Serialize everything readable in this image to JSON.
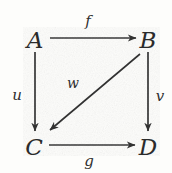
{
  "diagram": {
    "type": "commutative-square",
    "background_color": "#fdfdfb",
    "stroke_color": "#333333",
    "text_color": "#2b2b2b",
    "width": 172,
    "height": 173,
    "nodes": [
      {
        "id": "A",
        "label": "A",
        "x": 35,
        "y": 40
      },
      {
        "id": "B",
        "label": "B",
        "x": 148,
        "y": 40
      },
      {
        "id": "C",
        "label": "C",
        "x": 34,
        "y": 147
      },
      {
        "id": "D",
        "label": "D",
        "x": 148,
        "y": 147
      }
    ],
    "edges": [
      {
        "id": "f",
        "label": "f",
        "from": "A",
        "to": "B",
        "direction": "right",
        "x1": 50,
        "y1": 38,
        "x2": 136,
        "y2": 38,
        "label_x": 88,
        "label_y": 21
      },
      {
        "id": "u",
        "label": "u",
        "from": "A",
        "to": "C",
        "direction": "down",
        "x1": 35,
        "y1": 52,
        "x2": 35,
        "y2": 131,
        "label_x": 17,
        "label_y": 95
      },
      {
        "id": "v",
        "label": "v",
        "from": "B",
        "to": "D",
        "direction": "down",
        "x1": 148,
        "y1": 52,
        "x2": 148,
        "y2": 131,
        "label_x": 160,
        "label_y": 96
      },
      {
        "id": "g",
        "label": "g",
        "from": "C",
        "to": "D",
        "direction": "right",
        "x1": 49,
        "y1": 145,
        "x2": 135,
        "y2": 145,
        "label_x": 89,
        "label_y": 161
      },
      {
        "id": "w",
        "label": "w",
        "from": "B",
        "to": "C",
        "direction": "diagonal-down-left",
        "x1": 140,
        "y1": 54,
        "x2": 49,
        "y2": 131,
        "label_x": 73,
        "label_y": 83
      }
    ]
  }
}
